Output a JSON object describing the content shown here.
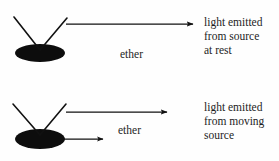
{
  "figure": {
    "background_color": "#fefefe",
    "ink_color": "#111111",
    "width": 279,
    "height": 161
  },
  "panels": [
    {
      "id": "source-at-rest",
      "source": {
        "shape": "filled-ellipse",
        "cx": 40,
        "cy": 53,
        "rx": 25,
        "ry": 9,
        "color": "#0d0d0d"
      },
      "antenna": {
        "apex_x": 40,
        "apex_y": 50,
        "left_tip_x": 14,
        "left_tip_y": 17,
        "right_tip_x": 67,
        "right_tip_y": 18
      },
      "light_arrow": {
        "label": "light ray",
        "x1": 66,
        "y1": 24,
        "x2": 196,
        "y2": 24
      },
      "motion_arrow": null,
      "medium_label": "ether",
      "caption_lines": [
        "light emitted",
        "from source",
        "at rest"
      ]
    },
    {
      "id": "source-in-motion",
      "source": {
        "shape": "filled-ellipse",
        "cx": 40,
        "cy": 139,
        "rx": 25,
        "ry": 10,
        "color": "#0d0d0d"
      },
      "antenna": {
        "apex_x": 40,
        "apex_y": 135,
        "left_tip_x": 13,
        "left_tip_y": 104,
        "right_tip_x": 66,
        "right_tip_y": 104
      },
      "light_arrow": {
        "label": "light ray",
        "x1": 66,
        "y1": 112,
        "x2": 170,
        "y2": 112
      },
      "motion_arrow": {
        "label": "source motion",
        "x1": 64,
        "y1": 139,
        "x2": 106,
        "y2": 139
      },
      "medium_label": "ether",
      "caption_lines": [
        "light emitted",
        "from moving",
        "source"
      ]
    }
  ]
}
